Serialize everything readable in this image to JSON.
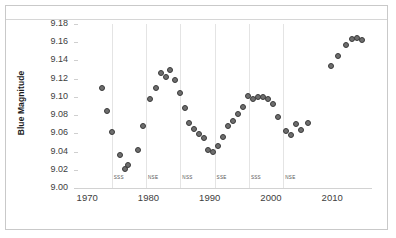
{
  "chart_data": {
    "type": "scatter",
    "title": "",
    "xlabel": "",
    "ylabel": "Blue Magnitude",
    "xlim": [
      1968.5,
      2016.5
    ],
    "ylim": [
      9.0,
      9.18
    ],
    "grid": "vertical-only",
    "legend": "none",
    "marker": {
      "shape": "circle",
      "fill": "#6e6e6e",
      "edge": "#3a3a3a",
      "size": 6
    },
    "yticks": [
      "9.18",
      "9.16",
      "9.14",
      "9.12",
      "9.10",
      "9.08",
      "9.06",
      "9.04",
      "9.02",
      "9.00"
    ],
    "ytick_values": [
      9.18,
      9.16,
      9.14,
      9.12,
      9.1,
      9.08,
      9.06,
      9.04,
      9.02,
      9.0
    ],
    "xticks": [
      "1970",
      "1980",
      "1990",
      "2000",
      "2010"
    ],
    "xtick_values": [
      1970,
      1980,
      1990,
      2000,
      2010
    ],
    "annotations": [
      {
        "label": "SSS",
        "x": 1974.0
      },
      {
        "label": "NSE",
        "x": 1979.6
      },
      {
        "label": "NSS",
        "x": 1985.2
      },
      {
        "label": "SSE",
        "x": 1990.8
      },
      {
        "label": "SSS",
        "x": 1996.4
      },
      {
        "label": "NSE",
        "x": 2002.0
      }
    ],
    "gridlines_x": [
      1974.0,
      1979.6,
      1985.2,
      1990.8,
      1996.4,
      2002.0
    ],
    "x": [
      1972.4,
      1973.3,
      1974.1,
      1975.3,
      1976.1,
      1976.7,
      1978.3,
      1979.1,
      1980.3,
      1981.2,
      1982.1,
      1982.9,
      1983.5,
      1984.3,
      1985.2,
      1985.9,
      1986.6,
      1987.4,
      1988.2,
      1989.0,
      1989.8,
      1990.6,
      1991.4,
      1992.2,
      1993.0,
      1993.8,
      1994.6,
      1995.4,
      1996.2,
      1997.1,
      1997.9,
      1998.7,
      1999.5,
      2000.3,
      2001.1,
      2002.5,
      2003.3,
      2004.1,
      2004.9,
      2006.1,
      2009.8,
      2011.0,
      2012.3,
      2013.2,
      2014.0,
      2014.8
    ],
    "y": [
      9.11,
      9.085,
      9.062,
      9.036,
      9.021,
      9.025,
      9.042,
      9.068,
      9.098,
      9.11,
      9.126,
      9.122,
      9.13,
      9.119,
      9.104,
      9.088,
      9.071,
      9.065,
      9.059,
      9.055,
      9.042,
      9.039,
      9.046,
      9.056,
      9.068,
      9.074,
      9.081,
      9.089,
      9.101,
      9.098,
      9.1,
      9.1,
      9.098,
      9.092,
      9.078,
      9.063,
      9.058,
      9.07,
      9.064,
      9.071,
      9.134,
      9.145,
      9.157,
      9.163,
      9.165,
      9.162
    ],
    "points": [
      {
        "x": 1972.4,
        "y": 9.11
      },
      {
        "x": 1973.3,
        "y": 9.085
      },
      {
        "x": 1974.1,
        "y": 9.062
      },
      {
        "x": 1975.3,
        "y": 9.036
      },
      {
        "x": 1976.1,
        "y": 9.021
      },
      {
        "x": 1976.7,
        "y": 9.025
      },
      {
        "x": 1978.3,
        "y": 9.042
      },
      {
        "x": 1979.1,
        "y": 9.068
      },
      {
        "x": 1980.3,
        "y": 9.098
      },
      {
        "x": 1981.2,
        "y": 9.11
      },
      {
        "x": 1982.1,
        "y": 9.126
      },
      {
        "x": 1982.9,
        "y": 9.122
      },
      {
        "x": 1983.5,
        "y": 9.13
      },
      {
        "x": 1984.3,
        "y": 9.119
      },
      {
        "x": 1985.2,
        "y": 9.104
      },
      {
        "x": 1985.9,
        "y": 9.088
      },
      {
        "x": 1986.6,
        "y": 9.071
      },
      {
        "x": 1987.4,
        "y": 9.065
      },
      {
        "x": 1988.2,
        "y": 9.059
      },
      {
        "x": 1989.0,
        "y": 9.055
      },
      {
        "x": 1989.8,
        "y": 9.042
      },
      {
        "x": 1990.6,
        "y": 9.039
      },
      {
        "x": 1991.4,
        "y": 9.046
      },
      {
        "x": 1992.2,
        "y": 9.056
      },
      {
        "x": 1993.0,
        "y": 9.068
      },
      {
        "x": 1993.8,
        "y": 9.074
      },
      {
        "x": 1994.6,
        "y": 9.081
      },
      {
        "x": 1995.4,
        "y": 9.089
      },
      {
        "x": 1996.2,
        "y": 9.101
      },
      {
        "x": 1997.1,
        "y": 9.098
      },
      {
        "x": 1997.9,
        "y": 9.1
      },
      {
        "x": 1998.7,
        "y": 9.1
      },
      {
        "x": 1999.5,
        "y": 9.098
      },
      {
        "x": 2000.3,
        "y": 9.092
      },
      {
        "x": 2001.1,
        "y": 9.078
      },
      {
        "x": 2002.5,
        "y": 9.063
      },
      {
        "x": 2003.3,
        "y": 9.058
      },
      {
        "x": 2004.1,
        "y": 9.07
      },
      {
        "x": 2004.9,
        "y": 9.064
      },
      {
        "x": 2006.1,
        "y": 9.071
      },
      {
        "x": 2009.8,
        "y": 9.134
      },
      {
        "x": 2011.0,
        "y": 9.145
      },
      {
        "x": 2012.3,
        "y": 9.157
      },
      {
        "x": 2013.2,
        "y": 9.163
      },
      {
        "x": 2014.0,
        "y": 9.165
      },
      {
        "x": 2014.8,
        "y": 9.162
      }
    ]
  }
}
